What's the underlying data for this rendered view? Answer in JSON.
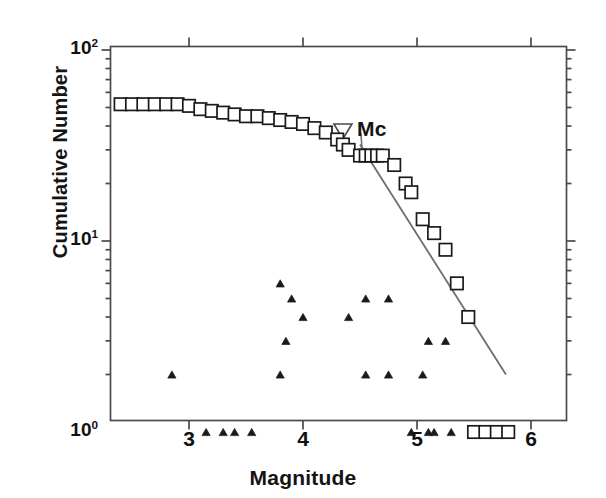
{
  "figure": {
    "width": 606,
    "height": 498,
    "background": "#ffffff",
    "line_color": "#6e6e6e",
    "marker_color": "#1a1a1a",
    "axis_color": "#4a4a4a"
  },
  "axes": {
    "x_title": "Magnitude",
    "y_title": "Cumulative Number",
    "x_ticklabels": [
      "3",
      "4",
      "5",
      "6"
    ],
    "y_ticklabels": [
      "10",
      "10",
      "10"
    ],
    "y_tick_exponents": [
      "2",
      "1",
      "0"
    ]
  },
  "annotations": {
    "mc_label": "Mc",
    "mc_marker": "open-down-triangle",
    "mc_magnitude": 4.35,
    "fit_line_label": "gutenberg-richter-fit-line"
  },
  "chart_data": {
    "type": "scatter",
    "title": "",
    "subtitle": "",
    "xlabel": "Magnitude",
    "ylabel": "Cumulative Number",
    "xlim": [
      2.37,
      6.0
    ],
    "ylim": [
      1,
      100
    ],
    "yscale": "log",
    "xscale": "linear",
    "grid": false,
    "legend": null,
    "xticks": [
      3,
      4,
      5,
      6
    ],
    "yticks": [
      1,
      10,
      100
    ],
    "annotations": [
      {
        "text": "Mc",
        "marker": "open-down-triangle",
        "x": 4.35,
        "y": 35,
        "note": "magnitude of completeness marker with leader line to the cumulative curve"
      }
    ],
    "series": [
      {
        "name": "Cumulative Number",
        "marker": "open-square",
        "type": "scatter",
        "points": [
          [
            2.4,
            52
          ],
          [
            2.5,
            52
          ],
          [
            2.6,
            52
          ],
          [
            2.7,
            52
          ],
          [
            2.8,
            52
          ],
          [
            2.9,
            52
          ],
          [
            3.0,
            51
          ],
          [
            3.1,
            49
          ],
          [
            3.2,
            48
          ],
          [
            3.3,
            47
          ],
          [
            3.4,
            46
          ],
          [
            3.5,
            45
          ],
          [
            3.6,
            45
          ],
          [
            3.7,
            44
          ],
          [
            3.8,
            43
          ],
          [
            3.9,
            42
          ],
          [
            4.0,
            41
          ],
          [
            4.1,
            39
          ],
          [
            4.2,
            37
          ],
          [
            4.3,
            34
          ],
          [
            4.35,
            32
          ],
          [
            4.4,
            30
          ],
          [
            4.5,
            28
          ],
          [
            4.55,
            28
          ],
          [
            4.6,
            28
          ],
          [
            4.65,
            28
          ],
          [
            4.7,
            28
          ],
          [
            4.8,
            25
          ],
          [
            4.9,
            20
          ],
          [
            4.95,
            18
          ],
          [
            5.05,
            13
          ],
          [
            5.15,
            11
          ],
          [
            5.25,
            9
          ],
          [
            5.35,
            6
          ],
          [
            5.45,
            4
          ],
          [
            5.5,
            1
          ],
          [
            5.6,
            1
          ],
          [
            5.7,
            1
          ],
          [
            5.8,
            1
          ]
        ]
      },
      {
        "name": "Non-cumulative (discrete) Number",
        "marker": "filled-triangle",
        "type": "scatter",
        "points": [
          [
            2.85,
            2
          ],
          [
            3.15,
            1
          ],
          [
            3.3,
            1
          ],
          [
            3.4,
            1
          ],
          [
            3.55,
            1
          ],
          [
            3.8,
            6
          ],
          [
            3.9,
            5
          ],
          [
            4.0,
            4
          ],
          [
            3.85,
            3
          ],
          [
            3.8,
            2
          ],
          [
            4.55,
            5
          ],
          [
            4.75,
            5
          ],
          [
            4.4,
            4
          ],
          [
            4.55,
            2
          ],
          [
            4.75,
            2
          ],
          [
            5.05,
            2
          ],
          [
            5.1,
            3
          ],
          [
            5.25,
            3
          ],
          [
            4.95,
            1
          ],
          [
            5.1,
            1
          ],
          [
            5.15,
            1
          ],
          [
            5.3,
            1
          ],
          [
            5.8,
            1
          ]
        ]
      }
    ],
    "fit_line": {
      "name": "b-value fit",
      "x_start": 4.5,
      "y_start": 32,
      "x_end": 5.78,
      "y_end": 2.0,
      "style": "solid",
      "color": "#6e6e6e"
    }
  }
}
